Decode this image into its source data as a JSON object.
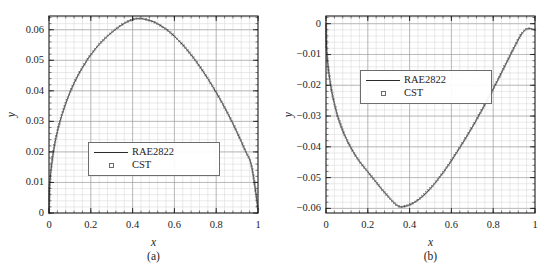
{
  "figure": {
    "panels": [
      {
        "id": "a",
        "subcaption": "(a)",
        "xlabel": "x",
        "ylabel": "y",
        "legend": [
          {
            "label": "RAE2822",
            "key": "line"
          },
          {
            "label": "CST",
            "key": "square"
          }
        ],
        "xticks": [
          "0",
          "0.2",
          "0.4",
          "0.6",
          "0.8",
          "1"
        ],
        "yticks": [
          "0",
          "0.01",
          "0.02",
          "0.03",
          "0.04",
          "0.05",
          "0.06"
        ]
      },
      {
        "id": "b",
        "subcaption": "(b)",
        "xlabel": "x",
        "ylabel": "y",
        "legend": [
          {
            "label": "RAE2822",
            "key": "line"
          },
          {
            "label": "CST",
            "key": "square"
          }
        ],
        "xticks": [
          "0",
          "0.2",
          "0.4",
          "0.6",
          "0.8",
          "1"
        ],
        "yticks": [
          "0",
          "-0.01",
          "-0.02",
          "-0.03",
          "-0.04",
          "-0.05",
          "-0.06"
        ]
      }
    ]
  },
  "colors": {
    "curve": "#2a2a2a",
    "marker_stroke": "#6b6b6b",
    "axis": "#1d1d1d",
    "grid_major": "#9a9a9a",
    "grid_minor": "#d4d4d4",
    "background": "#ffffff",
    "legend_border": "#6d6d6d"
  },
  "chart_data": [
    {
      "type": "line",
      "title": "",
      "subtitle": "(a)",
      "xlabel": "x",
      "ylabel": "y",
      "xlim": [
        0,
        1
      ],
      "ylim": [
        0,
        0.0645
      ],
      "grid": true,
      "grid_major_x": [
        0,
        0.2,
        0.4,
        0.6,
        0.8,
        1
      ],
      "grid_major_y": [
        0,
        0.01,
        0.02,
        0.03,
        0.04,
        0.05,
        0.06
      ],
      "grid_minor_x_step": 0.04,
      "grid_minor_y_step": 0.002,
      "legend_position": "center-left",
      "series": [
        {
          "name": "RAE2822",
          "style": "line",
          "x": [
            0.0,
            0.002,
            0.005,
            0.01,
            0.02,
            0.03,
            0.04,
            0.05,
            0.06,
            0.08,
            0.1,
            0.12,
            0.14,
            0.16,
            0.18,
            0.2,
            0.24,
            0.28,
            0.32,
            0.36,
            0.4,
            0.42,
            0.44,
            0.46,
            0.5,
            0.54,
            0.58,
            0.62,
            0.66,
            0.7,
            0.74,
            0.78,
            0.82,
            0.86,
            0.9,
            0.94,
            0.97,
            1.0
          ],
          "y": [
            0.0,
            0.0065,
            0.0102,
            0.0142,
            0.0195,
            0.0235,
            0.0266,
            0.0293,
            0.0317,
            0.0358,
            0.0394,
            0.0425,
            0.0452,
            0.0476,
            0.0498,
            0.0518,
            0.0552,
            0.0579,
            0.0602,
            0.0621,
            0.0633,
            0.0636,
            0.0636,
            0.0634,
            0.0626,
            0.0611,
            0.0591,
            0.0565,
            0.0535,
            0.05,
            0.0461,
            0.0418,
            0.0371,
            0.032,
            0.0264,
            0.0203,
            0.0152,
            0.0013
          ]
        },
        {
          "name": "CST",
          "style": "markers",
          "x": [
            0.0,
            0.002,
            0.005,
            0.01,
            0.02,
            0.03,
            0.04,
            0.05,
            0.06,
            0.08,
            0.1,
            0.12,
            0.14,
            0.16,
            0.18,
            0.2,
            0.24,
            0.28,
            0.32,
            0.36,
            0.4,
            0.42,
            0.44,
            0.46,
            0.5,
            0.54,
            0.58,
            0.62,
            0.66,
            0.7,
            0.74,
            0.78,
            0.82,
            0.86,
            0.9,
            0.94,
            0.97,
            1.0
          ],
          "y": [
            0.0,
            0.0065,
            0.0102,
            0.0142,
            0.0195,
            0.0235,
            0.0266,
            0.0293,
            0.0317,
            0.0358,
            0.0394,
            0.0425,
            0.0452,
            0.0476,
            0.0498,
            0.0518,
            0.0552,
            0.0579,
            0.0602,
            0.0621,
            0.0633,
            0.0636,
            0.0636,
            0.0634,
            0.0626,
            0.0611,
            0.0591,
            0.0565,
            0.0535,
            0.05,
            0.0461,
            0.0418,
            0.0371,
            0.032,
            0.0264,
            0.0203,
            0.0152,
            0.0013
          ]
        }
      ]
    },
    {
      "type": "line",
      "title": "",
      "subtitle": "(b)",
      "xlabel": "x",
      "ylabel": "y",
      "xlim": [
        0,
        1
      ],
      "ylim": [
        -0.0615,
        0.0025
      ],
      "grid": true,
      "grid_major_x": [
        0,
        0.2,
        0.4,
        0.6,
        0.8,
        1
      ],
      "grid_major_y": [
        0,
        -0.01,
        -0.02,
        -0.03,
        -0.04,
        -0.05,
        -0.06
      ],
      "grid_minor_x_step": 0.04,
      "grid_minor_y_step": 0.002,
      "legend_position": "upper-center-left",
      "series": [
        {
          "name": "RAE2822",
          "style": "line",
          "x": [
            0.0,
            0.002,
            0.005,
            0.01,
            0.02,
            0.03,
            0.04,
            0.05,
            0.06,
            0.08,
            0.1,
            0.12,
            0.14,
            0.16,
            0.18,
            0.2,
            0.24,
            0.28,
            0.32,
            0.35,
            0.38,
            0.42,
            0.46,
            0.5,
            0.54,
            0.58,
            0.62,
            0.66,
            0.7,
            0.74,
            0.78,
            0.82,
            0.86,
            0.9,
            0.93,
            0.95,
            0.97,
            1.0
          ],
          "y": [
            0.0,
            -0.0063,
            -0.0099,
            -0.0138,
            -0.0189,
            -0.0228,
            -0.0259,
            -0.0286,
            -0.0309,
            -0.0347,
            -0.0378,
            -0.0404,
            -0.0427,
            -0.0447,
            -0.0465,
            -0.0481,
            -0.0515,
            -0.0548,
            -0.0578,
            -0.0594,
            -0.0593,
            -0.0582,
            -0.0562,
            -0.0535,
            -0.0502,
            -0.0465,
            -0.0424,
            -0.0381,
            -0.0336,
            -0.0288,
            -0.0238,
            -0.0186,
            -0.0132,
            -0.0078,
            -0.004,
            -0.0022,
            -0.0016,
            -0.002
          ]
        },
        {
          "name": "CST",
          "style": "markers",
          "x": [
            0.0,
            0.002,
            0.005,
            0.01,
            0.02,
            0.03,
            0.04,
            0.05,
            0.06,
            0.08,
            0.1,
            0.12,
            0.14,
            0.16,
            0.18,
            0.2,
            0.24,
            0.28,
            0.32,
            0.35,
            0.38,
            0.42,
            0.46,
            0.5,
            0.54,
            0.58,
            0.62,
            0.66,
            0.7,
            0.74,
            0.78,
            0.82,
            0.86,
            0.9,
            0.93,
            0.95,
            0.97,
            1.0
          ],
          "y": [
            0.0,
            -0.0063,
            -0.0099,
            -0.0138,
            -0.0189,
            -0.0228,
            -0.0259,
            -0.0286,
            -0.0309,
            -0.0347,
            -0.0378,
            -0.0404,
            -0.0427,
            -0.0447,
            -0.0465,
            -0.0481,
            -0.0515,
            -0.0548,
            -0.0578,
            -0.0594,
            -0.0593,
            -0.0582,
            -0.0562,
            -0.0535,
            -0.0502,
            -0.0465,
            -0.0424,
            -0.0381,
            -0.0336,
            -0.0288,
            -0.0238,
            -0.0186,
            -0.0132,
            -0.0078,
            -0.004,
            -0.0022,
            -0.0016,
            -0.002
          ]
        }
      ]
    }
  ]
}
